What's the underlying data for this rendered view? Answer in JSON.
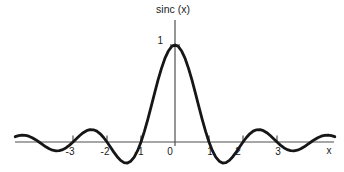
{
  "figure": {
    "background": "#ffffff"
  },
  "chart_data": {
    "type": "line",
    "title": "sinc (x)",
    "xlabel": "x",
    "ylabel": "",
    "x_tick_labels": [
      "-3",
      "-2",
      "-1",
      "0",
      "1",
      "2",
      "3"
    ],
    "x_ticks": [
      -3,
      -2,
      -1,
      0,
      1,
      2,
      3
    ],
    "y_tick_labels": [
      "1"
    ],
    "y_ticks": [
      1
    ],
    "xlim": [
      -4.7,
      4.7
    ],
    "ylim": [
      -0.31,
      1.26
    ],
    "grid": false,
    "legend": false,
    "curve_color": "#161616",
    "axis_color": "#4f4f4f",
    "text_color": "#1a1a1a",
    "series": [
      {
        "name": "sinc(x) = sin(pi*x)/(pi*x)",
        "x_start": -4.7,
        "x_step": 0.1,
        "values": [
          0.0548,
          0.0658,
          0.0707,
          0.0688,
          0.0599,
          0.0445,
          0.024,
          0.0,
          -0.0252,
          -0.0492,
          -0.0696,
          -0.0841,
          -0.0909,
          -0.089,
          -0.078,
          -0.0585,
          -0.0317,
          0.0,
          0.0339,
          0.0668,
          0.0954,
          0.1164,
          0.1273,
          0.1261,
          0.112,
          0.085,
          0.0468,
          0.0,
          -0.0518,
          -0.1039,
          -0.1515,
          -0.1892,
          -0.2122,
          -0.2162,
          -0.1981,
          -0.1559,
          -0.0894,
          0.0,
          0.1093,
          0.2339,
          0.3679,
          0.5046,
          0.6366,
          0.7568,
          0.8584,
          0.9355,
          0.9836,
          1.0,
          0.9836,
          0.9355,
          0.8584,
          0.7568,
          0.6366,
          0.5046,
          0.3679,
          0.2339,
          0.1093,
          0.0,
          -0.0894,
          -0.1559,
          -0.1981,
          -0.2162,
          -0.2122,
          -0.1892,
          -0.1515,
          -0.1039,
          -0.0518,
          0.0,
          0.0468,
          0.085,
          0.112,
          0.1261,
          0.1273,
          0.1164,
          0.0954,
          0.0668,
          0.0339,
          0.0,
          -0.0317,
          -0.0585,
          -0.078,
          -0.089,
          -0.0909,
          -0.0841,
          -0.0696,
          -0.0492,
          -0.0252,
          0.0,
          0.024,
          0.0445,
          0.0599,
          0.0688,
          0.0707,
          0.0658,
          0.0548
        ]
      }
    ]
  }
}
